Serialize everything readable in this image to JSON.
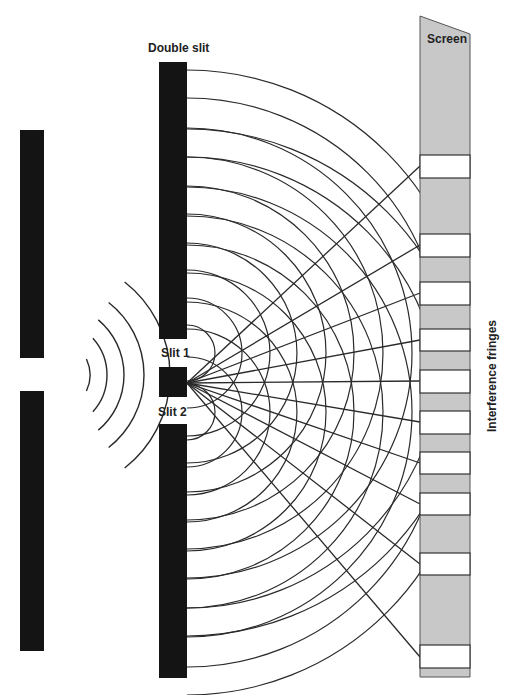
{
  "labels": {
    "double_slit": "Double slit",
    "screen": "Screen",
    "slit1": "Slit 1",
    "slit2": "Slit 2",
    "fringes": "Interference fringes"
  },
  "colors": {
    "barrier": "#141414",
    "screen_fill": "#c8c8c8",
    "fringe_fill": "#ffffff",
    "line": "#2a2a2a",
    "text": "#222222"
  },
  "source_barrier": {
    "x": 20,
    "w": 24,
    "top": 130,
    "bottom": 651,
    "gap_top": 358,
    "gap_bottom": 391
  },
  "incoming_waves": {
    "cx": 20,
    "cy": 375,
    "radii": [
      38,
      55,
      72,
      92,
      118
    ],
    "half_angle_deg": [
      25,
      42,
      50,
      52,
      52
    ]
  },
  "double_slit": {
    "x": 159,
    "w": 28,
    "upper": [
      62,
      339
    ],
    "middle": [
      367,
      397
    ],
    "lower": [
      424,
      678
    ],
    "slit1_y": 353,
    "slit2_y": 412
  },
  "wave_radii": [
    28,
    55,
    83,
    110,
    139,
    167,
    196,
    225,
    255,
    283
  ],
  "screen": {
    "x": 420,
    "w": 50,
    "top_left": 16,
    "top_right": 34,
    "bottom": 677,
    "fringes": [
      [
        155,
        178
      ],
      [
        234,
        257
      ],
      [
        282,
        305
      ],
      [
        329,
        351
      ],
      [
        370,
        393
      ],
      [
        411,
        434
      ],
      [
        452,
        474
      ],
      [
        493,
        515
      ],
      [
        553,
        575
      ],
      [
        645,
        668
      ]
    ]
  },
  "rays": {
    "origin": [
      187,
      383
    ],
    "targets_y": [
      166,
      245,
      293,
      340,
      381,
      422,
      463,
      504,
      564,
      657
    ]
  }
}
